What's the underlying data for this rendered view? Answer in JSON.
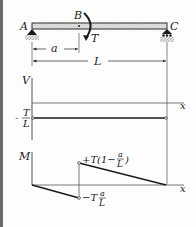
{
  "figure": {
    "type": "beam_shear_moment_diagram",
    "beam": {
      "points": {
        "A": "A",
        "B": "B",
        "C": "C"
      },
      "applied_moment": "T",
      "dimensions": {
        "a": "a",
        "L": "L"
      }
    },
    "shear_diagram": {
      "axis_label": "V",
      "x_label": "x",
      "value_numerator": "T",
      "value_denominator": "L",
      "value_sign": "-"
    },
    "moment_diagram": {
      "axis_label": "M",
      "x_label": "x",
      "upper_value": "+T(1−",
      "upper_frac_num": "a",
      "upper_frac_den": "L",
      "upper_close": ")",
      "lower_value": "−T",
      "lower_frac_num": "a",
      "lower_frac_den": "L"
    },
    "colors": {
      "line": "#2a2a2a",
      "beam_fill": "#d8d8d8",
      "ground_hatch": "#9a9a9a",
      "border": "#6a6a6a"
    }
  }
}
